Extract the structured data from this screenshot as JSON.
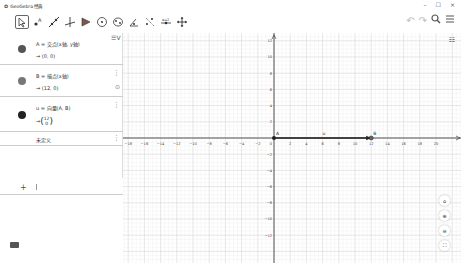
{
  "window": {
    "title": "GeoGebra 经典",
    "controls": [
      "–",
      "☐",
      "×"
    ]
  },
  "toolbar": {
    "tools": [
      {
        "name": "move-tool",
        "glyph": "⇱"
      },
      {
        "name": "point-tool",
        "glyph": "•"
      },
      {
        "name": "line-tool",
        "glyph": "╱"
      },
      {
        "name": "perpendicular-tool",
        "glyph": "⊥"
      },
      {
        "name": "polygon-tool",
        "glyph": "▶"
      },
      {
        "name": "circle-tool",
        "glyph": "⊙"
      },
      {
        "name": "conic-tool",
        "glyph": "◌"
      },
      {
        "name": "angle-tool",
        "glyph": "∢"
      },
      {
        "name": "reflect-tool",
        "glyph": "⋰"
      },
      {
        "name": "slider-tool",
        "glyph": "⇹"
      },
      {
        "name": "move-graphics-tool",
        "glyph": "✥"
      }
    ],
    "undo": "↶",
    "redo": "↷",
    "search": "🔍",
    "menu": "☰"
  },
  "algebra": {
    "toggle_label": "☰V",
    "items": [
      {
        "definition": "A = 交点(x轴, y轴)",
        "value": "→ (0, 0)",
        "color": "#555555"
      },
      {
        "definition": "B = 描点(x轴)",
        "value": "→ (12, 0)",
        "color": "#777777"
      },
      {
        "definition": "u = 向量(A, B)",
        "value": "→ (12 / 0)",
        "color": "#222222"
      },
      {
        "definition": "未定义",
        "value": ""
      }
    ],
    "input_plus": "+"
  },
  "graphics": {
    "x_ticks": [
      -18,
      -16,
      -14,
      -12,
      -10,
      -8,
      -6,
      -4,
      -2,
      0,
      2,
      4,
      6,
      8,
      10,
      12,
      14,
      16,
      18,
      20
    ],
    "y_ticks": [
      12,
      10,
      8,
      6,
      4,
      2,
      -2,
      -4,
      -6,
      -8,
      -10,
      -12
    ],
    "points": [
      {
        "label": "A",
        "x": 0,
        "y": 0
      },
      {
        "label": "B",
        "x": 12,
        "y": 0
      }
    ],
    "vector_label": "u",
    "origin_px": [
      151,
      105
    ],
    "unit_px": 8.1
  },
  "zoom_buttons": [
    {
      "name": "home-icon",
      "glyph": "⌂"
    },
    {
      "name": "zoom-in-icon",
      "glyph": "⊕"
    },
    {
      "name": "zoom-out-icon",
      "glyph": "⊖"
    },
    {
      "name": "fullscreen-icon",
      "glyph": "⛶"
    }
  ]
}
